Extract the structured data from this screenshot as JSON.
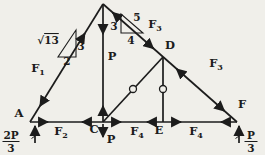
{
  "diagram": {
    "type": "truss-free-body-diagram",
    "points": {
      "a": "A",
      "c": "C",
      "d": "D",
      "e": "E",
      "f": "F"
    },
    "member_forces": {
      "f1": {
        "base": "F",
        "sub": "1"
      },
      "f2": {
        "base": "F",
        "sub": "2"
      },
      "f3_upper": {
        "base": "F",
        "sub": "3"
      },
      "f3_lower": {
        "base": "F",
        "sub": "3"
      },
      "f4_left": {
        "base": "F",
        "sub": "4"
      },
      "f4_right": {
        "base": "F",
        "sub": "4"
      },
      "bc_member_force": "P"
    },
    "applied_load_at_c": "P",
    "reactions": {
      "at_a": {
        "num": "2P",
        "den": "3"
      },
      "at_f": {
        "num": "P",
        "den": "3"
      }
    },
    "slope_triangle_left": {
      "radical_sign": "√",
      "hypotenuse": "13",
      "rise": "3",
      "run": "2"
    },
    "slope_triangle_right": {
      "rise": "3",
      "run": "4",
      "hypotenuse": "5"
    }
  },
  "colors": {
    "ink": "#1c1c1c",
    "background": "#f0efea"
  }
}
